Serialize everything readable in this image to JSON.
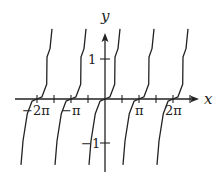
{
  "chart_data": {
    "type": "line",
    "title": "",
    "xlabel": "x",
    "ylabel": "y",
    "x_ticks": [
      -2,
      -1.5,
      -1,
      -0.5,
      0,
      0.5,
      1,
      1.5,
      2,
      2.5
    ],
    "x_tick_unit": "pi",
    "x_tick_labels": [
      {
        "value": -6.283,
        "label": "−2π"
      },
      {
        "value": -3.142,
        "label": "−π"
      },
      {
        "value": 3.142,
        "label": "π"
      },
      {
        "value": 6.283,
        "label": "2π"
      }
    ],
    "y_tick_labels": [
      {
        "value": 1,
        "label": "1"
      },
      {
        "value": -1,
        "label": "−1"
      }
    ],
    "xlim": [
      -7.2,
      8.5
    ],
    "ylim": [
      -1.75,
      1.65
    ],
    "period": 3.1416,
    "zeros": [
      -6.283,
      -3.142,
      0,
      3.142,
      6.283
    ],
    "vertical_asymptotes": [
      -7.854,
      -4.712,
      -1.571,
      1.571,
      4.712,
      7.854
    ],
    "branch_shape": {
      "description": "increasing tangent-like branches, flattened near zeros",
      "points": [
        {
          "dx": -1.48,
          "y": -1.57
        },
        {
          "dx": -1.29,
          "y": -1.0
        },
        {
          "dx": -0.9,
          "y": -0.35
        },
        {
          "dx": -0.45,
          "y": -0.05
        },
        {
          "dx": 0,
          "y": 0
        },
        {
          "dx": 0.45,
          "y": 0.05
        },
        {
          "dx": 0.9,
          "y": 0.35
        },
        {
          "dx": 0.92,
          "y": 1.0
        },
        {
          "dx": 1.2,
          "y": 1.2
        },
        {
          "dx": 1.39,
          "y": 1.67
        }
      ]
    },
    "grid": false,
    "legend": null
  }
}
